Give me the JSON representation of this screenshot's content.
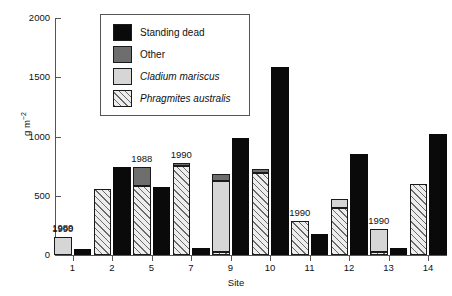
{
  "chart_data": {
    "type": "bar",
    "title": "",
    "xlabel": "Site",
    "ylabel": "g m⁻²",
    "ylim": [
      0,
      2000
    ],
    "yticks": [
      0,
      500,
      1000,
      1500,
      2000
    ],
    "ytick_labels": [
      "0",
      "500",
      "1000",
      "1500",
      "2000"
    ],
    "grid": false,
    "legend_position": "top-center-inside",
    "legend": [
      {
        "key": "standing_dead",
        "label": "Standing dead",
        "color": "#0a0a0a",
        "style": "solid",
        "italic": false
      },
      {
        "key": "other",
        "label": "Other",
        "color": "#6e6e6e",
        "style": "solid",
        "italic": false
      },
      {
        "key": "cladium",
        "label": "Cladium mariscus",
        "color": "#d6d6d6",
        "style": "solid",
        "italic": true
      },
      {
        "key": "phragmites",
        "label": "Phragmites australis",
        "color": "#ededed",
        "style": "hatched",
        "italic": true
      }
    ],
    "categories": [
      "1",
      "2",
      "5",
      "7",
      "9",
      "10",
      "11",
      "12",
      "13",
      "14"
    ],
    "series": [
      {
        "name": "Phragmites australis",
        "values": [
          0,
          555,
          580,
          755,
          25,
          690,
          290,
          395,
          25,
          600
        ]
      },
      {
        "name": "Cladium mariscus",
        "values": [
          150,
          0,
          0,
          0,
          600,
          0,
          0,
          80,
          195,
          0
        ]
      },
      {
        "name": "Other",
        "values": [
          0,
          0,
          160,
          25,
          60,
          35,
          0,
          0,
          0,
          0
        ]
      },
      {
        "name": "Standing dead",
        "values": [
          50,
          740,
          570,
          60,
          985,
          1590,
          180,
          855,
          60,
          1020
        ]
      }
    ],
    "annotations": [
      {
        "text": "1990",
        "category": "1",
        "bar": "live"
      },
      {
        "text": "1989",
        "category": "1",
        "bar": "dead"
      },
      {
        "text": "1988",
        "category": "5",
        "bar": "live"
      },
      {
        "text": "1990",
        "category": "7",
        "bar": "live"
      },
      {
        "text": "1990",
        "category": "11",
        "bar": "live"
      },
      {
        "text": "1990",
        "category": "13",
        "bar": "live"
      }
    ]
  }
}
